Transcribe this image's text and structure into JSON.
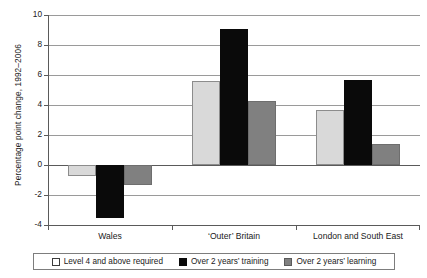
{
  "chart_data": {
    "type": "bar",
    "title": "",
    "xlabel": "",
    "ylabel": "Percentage point change, 1992–2006",
    "ylim": [
      -4,
      10
    ],
    "ytick_step": 2,
    "ytick_labels": [
      "10",
      "8",
      "6",
      "4",
      "2",
      "0",
      "-2",
      "-4"
    ],
    "grid": true,
    "legend_position": "bottom",
    "categories": [
      "Wales",
      "‘Outer’ Britain",
      "London and South East"
    ],
    "series": [
      {
        "name": "Level 4 and above required",
        "color": "#d9d9d9",
        "values": [
          -0.7,
          5.6,
          3.7
        ]
      },
      {
        "name": "Over 2 years’ training",
        "color": "#0a0a0a",
        "values": [
          -3.5,
          9.1,
          5.7
        ]
      },
      {
        "name": "Over 2 years’ learning",
        "color": "#808080",
        "values": [
          -1.3,
          4.3,
          1.4
        ]
      }
    ]
  }
}
